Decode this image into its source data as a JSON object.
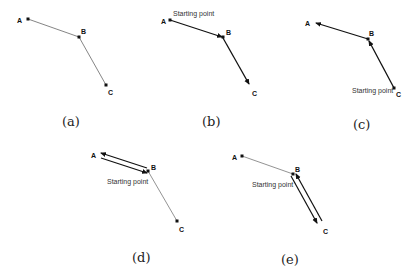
{
  "figure": {
    "points": [
      "A",
      "B",
      "C"
    ],
    "starting_point_label": "Starting point",
    "panels": [
      {
        "id": "a",
        "caption": "(a)",
        "labels": {
          "A": "A",
          "B": "B",
          "C": "C"
        },
        "description": "Path A-B-C, thin lines, no arrows"
      },
      {
        "id": "b",
        "caption": "(b)",
        "labels": {
          "A": "A",
          "B": "B",
          "C": "C"
        },
        "starting_point": "Starting point",
        "description": "Arrows A→B→C, starting at A"
      },
      {
        "id": "c",
        "caption": "(c)",
        "labels": {
          "A": "A",
          "B": "B",
          "C": "C"
        },
        "starting_point": "Starting point",
        "description": "Arrows C→B→A, starting at C"
      },
      {
        "id": "d",
        "caption": "(d)",
        "labels": {
          "A": "A",
          "B": "B",
          "C": "C"
        },
        "starting_point": "Starting point",
        "description": "Double arrows B→A→B, starting at B; B-C thin"
      },
      {
        "id": "e",
        "caption": "(e)",
        "labels": {
          "A": "A",
          "B": "B",
          "C": "C"
        },
        "starting_point": "Starting point",
        "description": "Double arrows B→C→B, starting at B; A-B thin"
      }
    ]
  }
}
